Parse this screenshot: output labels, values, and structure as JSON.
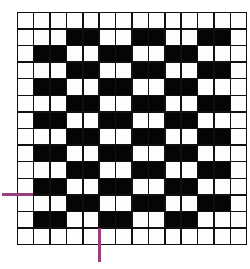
{
  "diagram": {
    "type": "weave-draft-grid",
    "rows": 14,
    "cols": 14,
    "colors": {
      "filled": "#050505",
      "empty": "#fdfdfd",
      "grid_line": "#111111",
      "marker": "#9a3d7c"
    },
    "pattern": [
      [
        0,
        0,
        0,
        0,
        0,
        0,
        0,
        0,
        0,
        0,
        0,
        0,
        0,
        0
      ],
      [
        0,
        0,
        0,
        1,
        1,
        0,
        0,
        1,
        1,
        0,
        0,
        1,
        1,
        0
      ],
      [
        0,
        1,
        1,
        0,
        0,
        1,
        1,
        0,
        0,
        1,
        1,
        0,
        0,
        0
      ],
      [
        0,
        0,
        0,
        1,
        1,
        0,
        0,
        1,
        1,
        0,
        0,
        1,
        1,
        0
      ],
      [
        0,
        1,
        1,
        0,
        0,
        1,
        1,
        0,
        0,
        1,
        1,
        0,
        0,
        0
      ],
      [
        0,
        0,
        0,
        1,
        1,
        0,
        0,
        1,
        1,
        0,
        0,
        1,
        1,
        0
      ],
      [
        0,
        1,
        1,
        0,
        0,
        1,
        1,
        0,
        0,
        1,
        1,
        0,
        0,
        0
      ],
      [
        0,
        0,
        0,
        1,
        1,
        0,
        0,
        1,
        1,
        0,
        0,
        1,
        1,
        0
      ],
      [
        0,
        1,
        1,
        0,
        0,
        1,
        1,
        0,
        0,
        1,
        1,
        0,
        0,
        0
      ],
      [
        0,
        0,
        0,
        1,
        1,
        0,
        0,
        1,
        1,
        0,
        0,
        1,
        1,
        0
      ],
      [
        0,
        1,
        1,
        0,
        0,
        1,
        1,
        0,
        0,
        1,
        1,
        0,
        0,
        0
      ],
      [
        0,
        0,
        0,
        1,
        1,
        0,
        0,
        1,
        1,
        0,
        0,
        1,
        1,
        0
      ],
      [
        0,
        1,
        1,
        0,
        0,
        1,
        1,
        0,
        0,
        1,
        1,
        0,
        0,
        0
      ],
      [
        0,
        0,
        0,
        0,
        0,
        0,
        0,
        0,
        0,
        0,
        0,
        0,
        0,
        0
      ]
    ],
    "markers": [
      {
        "orientation": "horizontal",
        "position": "left side, between row 10 and row 11"
      },
      {
        "orientation": "vertical",
        "position": "bottom, between column 4 and column 5"
      }
    ]
  }
}
